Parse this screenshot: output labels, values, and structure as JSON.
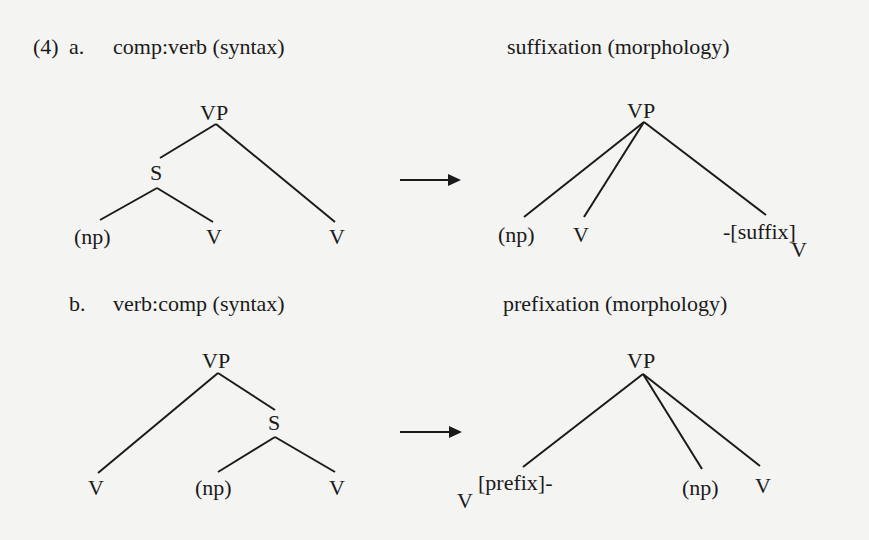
{
  "example_number": "(4)",
  "examples": [
    {
      "letter": "a.",
      "syntax_heading": "comp:verb (syntax)",
      "morphology_heading": "suffixation (morphology)",
      "syntax_tree": {
        "root": "VP",
        "internal": "S",
        "leaves": [
          "(np)",
          "V",
          "V"
        ]
      },
      "morphology_tree": {
        "root": "VP",
        "leaves": [
          "(np)",
          "V",
          "-[suffix]"
        ],
        "affix_subscript": "V"
      }
    },
    {
      "letter": "b.",
      "syntax_heading": "verb:comp (syntax)",
      "morphology_heading": "prefixation (morphology)",
      "syntax_tree": {
        "root": "VP",
        "internal": "S",
        "leaves": [
          "V",
          "(np)",
          "V"
        ]
      },
      "morphology_tree": {
        "root": "VP",
        "leaves": [
          "[prefix]-",
          "(np)",
          "V"
        ],
        "affix_subscript": "V"
      }
    }
  ],
  "arrow_icon": "right-arrow",
  "colors": {
    "background": "#f4f4f2",
    "ink": "#1a1a1a"
  }
}
